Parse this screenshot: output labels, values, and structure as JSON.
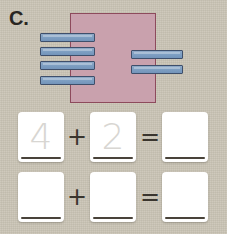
{
  "item": {
    "label": "C."
  },
  "colors": {
    "background": "#c9c3b4",
    "group_fill": "#c9a1ad",
    "group_border": "#8d4a5c",
    "bar_fill": "#7fa0c3",
    "bar_border": "#3e4f6b",
    "box_fill": "#ffffff",
    "traced_numeral": "#d8d6d2",
    "rule": "#49433a"
  },
  "manipulatives": {
    "description": "blue-bar counting rods grouped by a pink rectangle",
    "left_group": {
      "count": 4,
      "bars": [
        {
          "x": 40,
          "y": 33,
          "width": 55
        },
        {
          "x": 40,
          "y": 47,
          "width": 55
        },
        {
          "x": 40,
          "y": 61,
          "width": 55
        },
        {
          "x": 40,
          "y": 76,
          "width": 55
        }
      ]
    },
    "right_group": {
      "count": 2,
      "bars": [
        {
          "x": 131,
          "y": 50,
          "width": 52
        },
        {
          "x": 131,
          "y": 65,
          "width": 52
        }
      ]
    }
  },
  "equations": [
    {
      "name": "traced-equation",
      "addend_1": "4",
      "addend_2": "2",
      "operator_plus": "+",
      "operator_equals": "=",
      "sum": ""
    },
    {
      "name": "blank-equation",
      "addend_1": "",
      "addend_2": "",
      "operator_plus": "+",
      "operator_equals": "=",
      "sum": ""
    }
  ]
}
